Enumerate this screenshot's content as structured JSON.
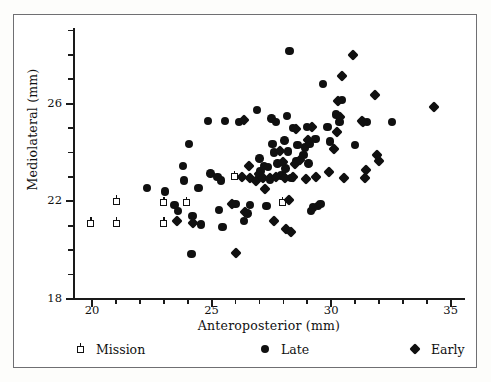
{
  "figure": {
    "background": "#ffffff",
    "frame_color": "#6f6f72",
    "marker_color": "#101010"
  },
  "chart_data": {
    "type": "scatter",
    "title": "",
    "xlabel": "Anteroposterior (mm)",
    "ylabel": "Mediolateral (mm)",
    "xlim": [
      19.2,
      35.6
    ],
    "ylim": [
      18.0,
      29.1
    ],
    "xticks_major": [
      20,
      25,
      30,
      35
    ],
    "xticks_major_labels": [
      "20",
      "25",
      "30",
      "35"
    ],
    "xticks_minor": [
      21,
      22,
      23,
      24,
      26,
      27,
      28,
      29,
      31,
      32,
      33,
      34
    ],
    "yticks_major": [
      18,
      22,
      26
    ],
    "yticks_major_labels": [
      "18",
      "22",
      "26"
    ],
    "yticks_minor": [
      19,
      20,
      21,
      23,
      24,
      25,
      27,
      28,
      29
    ],
    "grid": false,
    "legend_position": "below-axes",
    "series": [
      {
        "name": "Mission",
        "marker": "open-square-pin",
        "points": [
          [
            19.95,
            21.1
          ],
          [
            21.0,
            22.0
          ],
          [
            21.0,
            21.1
          ],
          [
            23.0,
            21.95
          ],
          [
            23.0,
            21.1
          ],
          [
            23.95,
            21.95
          ],
          [
            25.95,
            23.0
          ],
          [
            27.95,
            23.05
          ],
          [
            27.95,
            21.95
          ]
        ]
      },
      {
        "name": "Late",
        "marker": "filled-circle",
        "points": [
          [
            22.3,
            22.55
          ],
          [
            23.05,
            22.4
          ],
          [
            23.45,
            21.85
          ],
          [
            23.6,
            21.6
          ],
          [
            23.8,
            23.45
          ],
          [
            23.85,
            22.85
          ],
          [
            24.05,
            24.35
          ],
          [
            24.15,
            19.85
          ],
          [
            24.2,
            21.4
          ],
          [
            24.45,
            22.55
          ],
          [
            24.55,
            21.05
          ],
          [
            24.85,
            25.3
          ],
          [
            24.95,
            23.15
          ],
          [
            25.25,
            23.0
          ],
          [
            25.3,
            21.65
          ],
          [
            25.4,
            22.85
          ],
          [
            25.45,
            20.95
          ],
          [
            25.55,
            25.3
          ],
          [
            26.0,
            21.9
          ],
          [
            26.15,
            25.25
          ],
          [
            26.35,
            21.2
          ],
          [
            26.5,
            21.5
          ],
          [
            26.6,
            21.85
          ],
          [
            26.9,
            25.75
          ],
          [
            27.0,
            23.75
          ],
          [
            27.05,
            23.25
          ],
          [
            27.2,
            23.45
          ],
          [
            27.3,
            21.8
          ],
          [
            27.35,
            23.4
          ],
          [
            27.45,
            22.9
          ],
          [
            27.5,
            25.4
          ],
          [
            27.55,
            24.35
          ],
          [
            27.6,
            24.0
          ],
          [
            27.7,
            25.25
          ],
          [
            27.75,
            23.55
          ],
          [
            27.9,
            23.05
          ],
          [
            28.05,
            24.5
          ],
          [
            28.1,
            23.35
          ],
          [
            28.15,
            25.5
          ],
          [
            28.2,
            24.05
          ],
          [
            28.25,
            28.15
          ],
          [
            28.35,
            22.95
          ],
          [
            28.4,
            25.0
          ],
          [
            28.55,
            23.65
          ],
          [
            28.6,
            24.3
          ],
          [
            28.85,
            23.9
          ],
          [
            28.9,
            24.2
          ],
          [
            29.0,
            25.05
          ],
          [
            29.05,
            23.55
          ],
          [
            29.1,
            24.35
          ],
          [
            29.15,
            21.6
          ],
          [
            29.25,
            21.75
          ],
          [
            29.35,
            24.55
          ],
          [
            29.45,
            21.8
          ],
          [
            29.55,
            21.9
          ],
          [
            29.65,
            26.8
          ],
          [
            29.85,
            25.05
          ],
          [
            29.95,
            24.45
          ],
          [
            30.2,
            25.55
          ],
          [
            30.35,
            25.25
          ],
          [
            30.45,
            26.15
          ],
          [
            31.0,
            24.3
          ],
          [
            31.5,
            25.25
          ],
          [
            32.55,
            25.25
          ]
        ]
      },
      {
        "name": "Early",
        "marker": "filled-diamond",
        "points": [
          [
            23.55,
            21.2
          ],
          [
            24.2,
            21.1
          ],
          [
            25.85,
            21.9
          ],
          [
            26.0,
            19.9
          ],
          [
            26.25,
            23.0
          ],
          [
            26.35,
            25.35
          ],
          [
            26.4,
            21.55
          ],
          [
            26.55,
            23.45
          ],
          [
            26.6,
            22.95
          ],
          [
            26.85,
            22.85
          ],
          [
            27.0,
            23.1
          ],
          [
            27.15,
            22.95
          ],
          [
            27.25,
            22.5
          ],
          [
            27.45,
            22.95
          ],
          [
            27.6,
            21.2
          ],
          [
            27.7,
            23.0
          ],
          [
            27.85,
            24.05
          ],
          [
            28.0,
            23.6
          ],
          [
            28.05,
            22.95
          ],
          [
            28.1,
            20.85
          ],
          [
            28.25,
            22.05
          ],
          [
            28.3,
            20.75
          ],
          [
            28.4,
            23.0
          ],
          [
            28.5,
            23.55
          ],
          [
            28.55,
            24.95
          ],
          [
            28.7,
            23.7
          ],
          [
            28.95,
            22.9
          ],
          [
            29.05,
            24.5
          ],
          [
            29.2,
            25.05
          ],
          [
            29.35,
            23.0
          ],
          [
            29.9,
            23.2
          ],
          [
            30.1,
            24.15
          ],
          [
            30.25,
            24.85
          ],
          [
            30.3,
            26.1
          ],
          [
            30.35,
            25.45
          ],
          [
            30.45,
            27.15
          ],
          [
            30.55,
            22.95
          ],
          [
            30.9,
            28.0
          ],
          [
            31.3,
            25.3
          ],
          [
            31.35,
            25.25
          ],
          [
            31.4,
            22.95
          ],
          [
            31.45,
            23.3
          ],
          [
            31.85,
            26.35
          ],
          [
            31.9,
            23.9
          ],
          [
            32.0,
            23.65
          ],
          [
            34.3,
            25.85
          ]
        ]
      }
    ]
  },
  "legend": {
    "items": [
      {
        "label": "Mission",
        "marker": "open-square-pin"
      },
      {
        "label": "Late",
        "marker": "filled-circle"
      },
      {
        "label": "Early",
        "marker": "filled-diamond"
      }
    ]
  }
}
